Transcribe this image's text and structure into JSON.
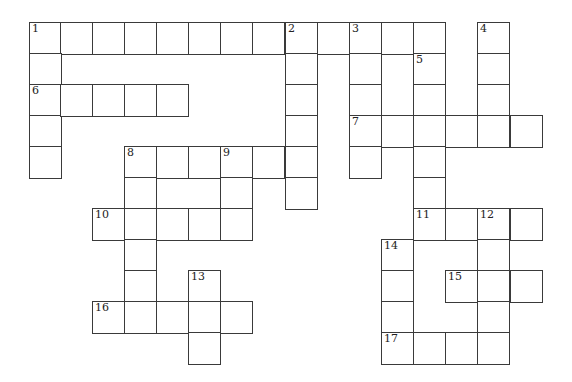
{
  "puzzle": {
    "type": "crossword",
    "cell_size": 32,
    "origin": {
      "x": 29,
      "y": 22
    },
    "col_x": [
      29,
      60,
      92,
      124,
      156,
      188,
      220,
      252,
      285,
      317,
      349,
      381,
      413,
      445,
      477,
      510
    ],
    "row_y": [
      22,
      53,
      84,
      115,
      146,
      177,
      208,
      239,
      270,
      301,
      332
    ],
    "entries": [
      {
        "number": 1,
        "direction": "across",
        "row": 0,
        "col": 0,
        "length": 13
      },
      {
        "number": 1,
        "direction": "down",
        "row": 0,
        "col": 0,
        "length": 5
      },
      {
        "number": 2,
        "direction": "down",
        "row": 0,
        "col": 8,
        "length": 6
      },
      {
        "number": 3,
        "direction": "down",
        "row": 0,
        "col": 10,
        "length": 5
      },
      {
        "number": 4,
        "direction": "down",
        "row": 0,
        "col": 14,
        "length": 4
      },
      {
        "number": 5,
        "direction": "down",
        "row": 1,
        "col": 12,
        "length": 6
      },
      {
        "number": 6,
        "direction": "across",
        "row": 2,
        "col": 0,
        "length": 5
      },
      {
        "number": 7,
        "direction": "across",
        "row": 3,
        "col": 10,
        "length": 6
      },
      {
        "number": 8,
        "direction": "across",
        "row": 4,
        "col": 3,
        "length": 6
      },
      {
        "number": 8,
        "direction": "down",
        "row": 4,
        "col": 3,
        "length": 6
      },
      {
        "number": 9,
        "direction": "down",
        "row": 4,
        "col": 6,
        "length": 3
      },
      {
        "number": 10,
        "direction": "across",
        "row": 6,
        "col": 2,
        "length": 5
      },
      {
        "number": 11,
        "direction": "across",
        "row": 6,
        "col": 12,
        "length": 4
      },
      {
        "number": 12,
        "direction": "down",
        "row": 6,
        "col": 14,
        "length": 5
      },
      {
        "number": 13,
        "direction": "down",
        "row": 8,
        "col": 5,
        "length": 3
      },
      {
        "number": 14,
        "direction": "down",
        "row": 7,
        "col": 11,
        "length": 4
      },
      {
        "number": 15,
        "direction": "across",
        "row": 8,
        "col": 13,
        "length": 3
      },
      {
        "number": 16,
        "direction": "across",
        "row": 9,
        "col": 2,
        "length": 5
      },
      {
        "number": 17,
        "direction": "across",
        "row": 10,
        "col": 11,
        "length": 4
      }
    ]
  }
}
